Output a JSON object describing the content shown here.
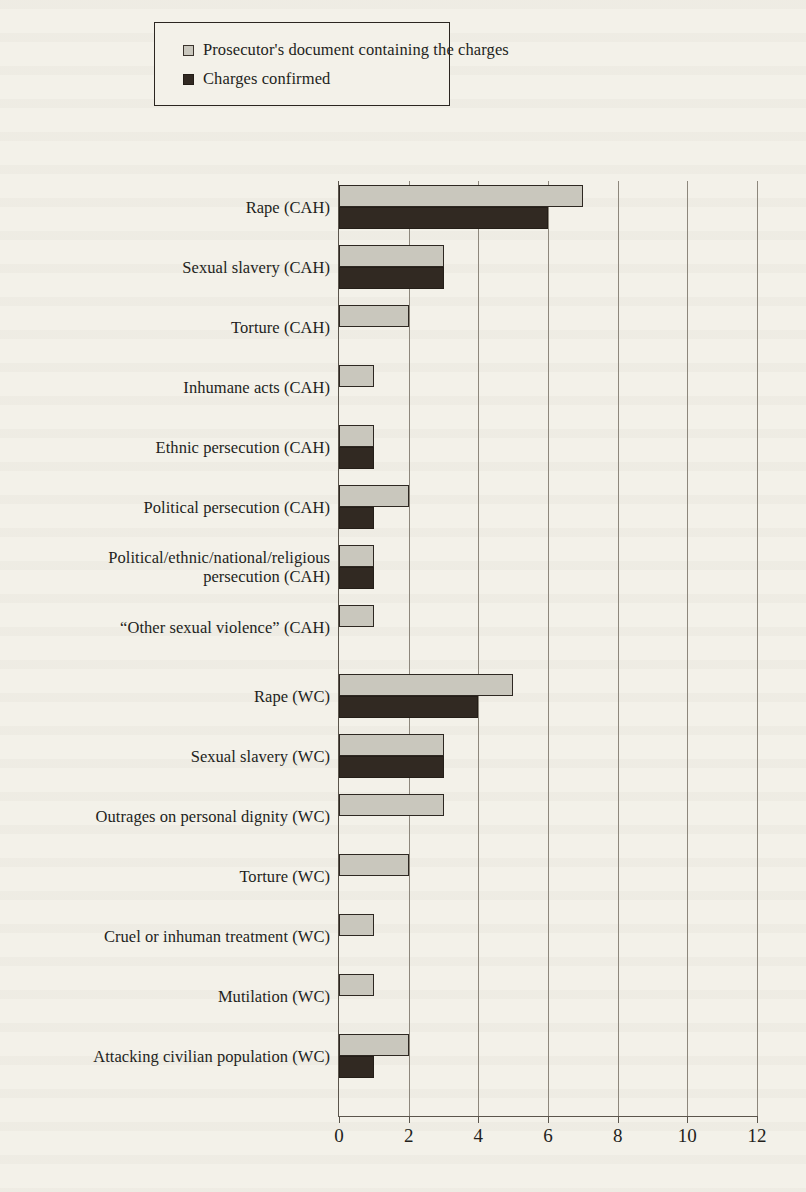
{
  "legend": {
    "items": [
      {
        "label": "Prosecutor's document containing the charges",
        "swatch": "light-square-icon",
        "color": "#c9c7bd"
      },
      {
        "label": "Charges confirmed",
        "swatch": "dark-square-icon",
        "color": "#312922"
      }
    ]
  },
  "axis": {
    "x_ticks": [
      "0",
      "2",
      "4",
      "6",
      "8",
      "10",
      "12"
    ]
  },
  "chart_data": {
    "type": "bar",
    "orientation": "horizontal",
    "title": "",
    "xlabel": "",
    "ylabel": "",
    "xlim": [
      0,
      12
    ],
    "xticks": [
      0,
      2,
      4,
      6,
      8,
      10,
      12
    ],
    "grid": true,
    "legend_position": "top",
    "categories": [
      "Rape (CAH)",
      "Sexual slavery (CAH)",
      "Torture (CAH)",
      "Inhumane acts (CAH)",
      "Ethnic persecution (CAH)",
      "Political persecution (CAH)",
      "Political/ethnic/national/religious\npersecution (CAH)",
      "“Other sexual violence” (CAH)",
      "Rape (WC)",
      "Sexual slavery (WC)",
      "Outrages on personal dignity (WC)",
      "Torture (WC)",
      "Cruel or inhuman treatment (WC)",
      "Mutilation (WC)",
      "Attacking civilian population (WC)"
    ],
    "series": [
      {
        "name": "Prosecutor's document containing the charges",
        "color": "#c9c7bd",
        "values": [
          7,
          3,
          2,
          1,
          1,
          2,
          1,
          1,
          5,
          3,
          3,
          2,
          1,
          1,
          2
        ]
      },
      {
        "name": "Charges confirmed",
        "color": "#312922",
        "values": [
          6,
          3,
          0,
          0,
          1,
          1,
          1,
          0,
          4,
          3,
          0,
          0,
          0,
          0,
          1
        ]
      }
    ]
  }
}
